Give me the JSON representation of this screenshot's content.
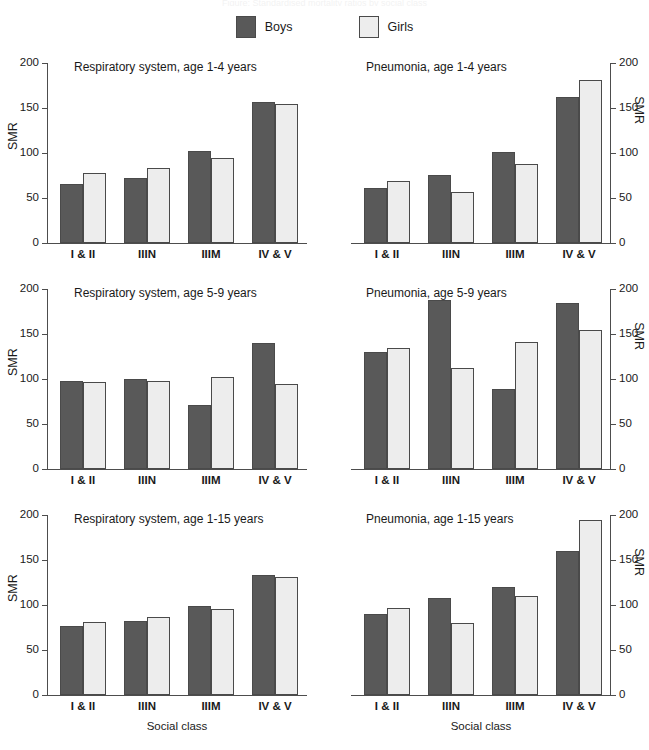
{
  "cut_title": "Figure: Standardised mortality ratios by social class",
  "legend": {
    "items": [
      {
        "label": "Boys",
        "color": "#595959",
        "swatch_name": "legend-swatch-boys"
      },
      {
        "label": "Girls",
        "color": "#ededed",
        "swatch_name": "legend-swatch-girls"
      }
    ]
  },
  "axis": {
    "y_label": "SMR",
    "x_label": "Social class",
    "ticks": [
      "0",
      "50",
      "100",
      "150",
      "200"
    ]
  },
  "chart_data": [
    {
      "id": "respiratory-1-4",
      "type": "bar",
      "title": "Respiratory system, age 1-4 years",
      "xlabel": "",
      "ylabel": "SMR",
      "ylim": [
        0,
        200
      ],
      "yticks": [
        0,
        50,
        100,
        150,
        200
      ],
      "grid": false,
      "legend_position": "top-center",
      "categories": [
        "I & II",
        "IIIN",
        "IIIM",
        "IV & V"
      ],
      "series": [
        {
          "name": "Boys",
          "values": [
            66,
            72,
            102,
            157
          ]
        },
        {
          "name": "Girls",
          "values": [
            78,
            83,
            95,
            155
          ]
        }
      ]
    },
    {
      "id": "pneumonia-1-4",
      "type": "bar",
      "title": "Pneumonia, age 1-4 years",
      "xlabel": "",
      "ylabel": "SMR",
      "ylim": [
        0,
        200
      ],
      "yticks": [
        0,
        50,
        100,
        150,
        200
      ],
      "grid": false,
      "legend_position": "top-center",
      "categories": [
        "I & II",
        "IIIN",
        "IIIM",
        "IV & V"
      ],
      "series": [
        {
          "name": "Boys",
          "values": [
            61,
            76,
            101,
            162
          ]
        },
        {
          "name": "Girls",
          "values": [
            69,
            57,
            88,
            181
          ]
        }
      ]
    },
    {
      "id": "respiratory-5-9",
      "type": "bar",
      "title": "Respiratory system, age 5-9 years",
      "xlabel": "",
      "ylabel": "SMR",
      "ylim": [
        0,
        200
      ],
      "yticks": [
        0,
        50,
        100,
        150,
        200
      ],
      "grid": false,
      "legend_position": "top-center",
      "categories": [
        "I & II",
        "IIIN",
        "IIIM",
        "IV & V"
      ],
      "series": [
        {
          "name": "Boys",
          "values": [
            98,
            100,
            71,
            140
          ]
        },
        {
          "name": "Girls",
          "values": [
            97,
            98,
            102,
            95
          ]
        }
      ]
    },
    {
      "id": "pneumonia-5-9",
      "type": "bar",
      "title": "Pneumonia, age 5-9 years",
      "xlabel": "",
      "ylabel": "SMR",
      "ylim": [
        0,
        200
      ],
      "yticks": [
        0,
        50,
        100,
        150,
        200
      ],
      "grid": false,
      "legend_position": "top-center",
      "categories": [
        "I & II",
        "IIIN",
        "IIIM",
        "IV & V"
      ],
      "series": [
        {
          "name": "Boys",
          "values": [
            130,
            188,
            89,
            185
          ]
        },
        {
          "name": "Girls",
          "values": [
            135,
            112,
            141,
            155
          ]
        }
      ]
    },
    {
      "id": "respiratory-1-15",
      "type": "bar",
      "title": "Respiratory system, age 1-15 years",
      "xlabel": "Social class",
      "ylabel": "SMR",
      "ylim": [
        0,
        200
      ],
      "yticks": [
        0,
        50,
        100,
        150,
        200
      ],
      "grid": false,
      "legend_position": "top-center",
      "categories": [
        "I & II",
        "IIIN",
        "IIIM",
        "IV & V"
      ],
      "series": [
        {
          "name": "Boys",
          "values": [
            77,
            82,
            99,
            133
          ]
        },
        {
          "name": "Girls",
          "values": [
            81,
            87,
            96,
            131
          ]
        }
      ]
    },
    {
      "id": "pneumonia-1-15",
      "type": "bar",
      "title": "Pneumonia, age 1-15 years",
      "xlabel": "Social class",
      "ylabel": "SMR",
      "ylim": [
        0,
        200
      ],
      "yticks": [
        0,
        50,
        100,
        150,
        200
      ],
      "grid": false,
      "legend_position": "top-center",
      "categories": [
        "I & II",
        "IIIN",
        "IIIM",
        "IV & V"
      ],
      "series": [
        {
          "name": "Boys",
          "values": [
            90,
            108,
            120,
            160
          ]
        },
        {
          "name": "Girls",
          "values": [
            97,
            80,
            110,
            194
          ]
        }
      ]
    }
  ]
}
